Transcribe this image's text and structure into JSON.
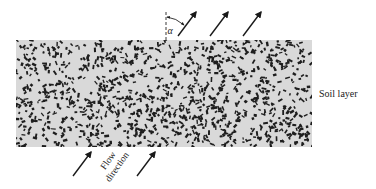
{
  "diagram": {
    "type": "soil-layer-flow",
    "soil_layer": {
      "label": "Soil layer",
      "x": 16,
      "y": 40,
      "width": 296,
      "height": 107,
      "fill": "#d9d9d9",
      "grain_color": "#1e1e1e",
      "grain_count": 1100,
      "seed": 7
    },
    "angle_label": "α",
    "flow_label_line1": "Flow",
    "flow_label_line2": "direction",
    "reference_line": {
      "x": 166,
      "y1": 12,
      "y2": 40
    },
    "outflow_arrows": [
      {
        "x1": 178,
        "y1": 36,
        "x2": 196,
        "y2": 12
      },
      {
        "x1": 210,
        "y1": 36,
        "x2": 228,
        "y2": 12
      },
      {
        "x1": 243,
        "y1": 36,
        "x2": 261,
        "y2": 12
      }
    ],
    "inflow_arrows": [
      {
        "x1": 73,
        "y1": 176,
        "x2": 91,
        "y2": 152
      },
      {
        "x1": 137,
        "y1": 176,
        "x2": 155,
        "y2": 152
      }
    ],
    "arrow_color": "#1a1a1a"
  }
}
